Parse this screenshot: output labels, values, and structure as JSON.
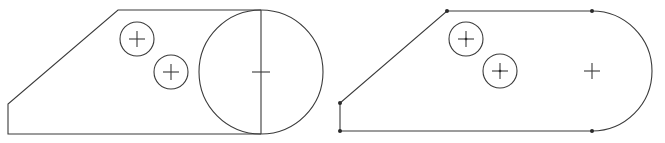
{
  "figure": {
    "colors": {
      "line": "#3a3a3a",
      "node": "#2a2a2a",
      "background": "#ffffff"
    },
    "left_sketch": {
      "outline_points": [
        [
          118,
          10
        ],
        [
          8,
          104
        ],
        [
          8,
          134
        ],
        [
          261,
          134
        ]
      ],
      "top_edge": [
        [
          118,
          10
        ],
        [
          261,
          10
        ]
      ],
      "big_circle": {
        "cx": 261,
        "cy": 72,
        "r": 62
      },
      "vertical_line": [
        [
          261,
          10
        ],
        [
          261,
          134
        ]
      ],
      "small_circles": [
        {
          "cx": 137,
          "cy": 39,
          "r": 17
        },
        {
          "cx": 171,
          "cy": 72,
          "r": 17
        }
      ]
    },
    "right_sketch": {
      "outline_points": [
        [
          592,
          11
        ],
        [
          447,
          11
        ],
        [
          340,
          103
        ],
        [
          340,
          131
        ],
        [
          592,
          131
        ]
      ],
      "arc": {
        "cx": 592,
        "cy": 71,
        "r": 60
      },
      "center_mark": {
        "cx": 592,
        "cy": 71
      },
      "small_circles": [
        {
          "cx": 466,
          "cy": 39,
          "r": 17
        },
        {
          "cx": 500,
          "cy": 71,
          "r": 17
        }
      ],
      "vertex_nodes": [
        [
          447,
          11
        ],
        [
          340,
          103
        ],
        [
          340,
          131
        ],
        [
          592,
          11
        ],
        [
          592,
          131
        ]
      ]
    }
  }
}
